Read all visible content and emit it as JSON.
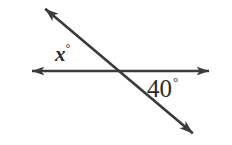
{
  "figure": {
    "kind": "geometry-diagram",
    "background_color": "#ffffff",
    "stroke_color": "#3a3a3a",
    "label_color": "#2b2b2b",
    "width": 232,
    "height": 145
  },
  "labels": {
    "x_angle": {
      "value": "x",
      "degree_symbol": "°",
      "position": "above horizontal line, left of intersection"
    },
    "known_angle": {
      "value": "40",
      "degree_symbol": "°",
      "position": "below horizontal line, right of intersection"
    }
  },
  "lines": [
    {
      "name": "horizontal-line",
      "double_headed": true,
      "from": [
        29,
        71
      ],
      "to": [
        212,
        71
      ]
    },
    {
      "name": "diagonal-line",
      "double_headed": true,
      "from": [
        42,
        6
      ],
      "to": [
        196,
        136
      ]
    }
  ],
  "intersection": {
    "x": 117,
    "y": 71
  },
  "arrowheads": [
    {
      "name": "arrow-left",
      "x": 29,
      "y": 71
    },
    {
      "name": "arrow-right",
      "x": 212,
      "y": 71
    },
    {
      "name": "arrow-upper-left",
      "x": 42,
      "y": 6
    },
    {
      "name": "arrow-lower-right",
      "x": 196,
      "y": 136
    }
  ]
}
